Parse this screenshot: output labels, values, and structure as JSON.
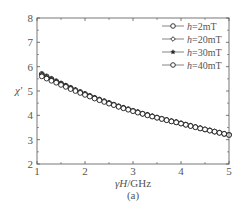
{
  "figure": {
    "caption": "(a)"
  },
  "chart_data": {
    "type": "line",
    "title": "",
    "xlabel": "γH/GHz",
    "xlabel_parts": {
      "var": "γH",
      "unit": "/GHz"
    },
    "ylabel": "χ'",
    "xlim": [
      1,
      5
    ],
    "ylim": [
      2,
      8
    ],
    "xticks": [
      1,
      2,
      3,
      4,
      5
    ],
    "yticks": [
      2,
      3,
      4,
      5,
      6,
      7,
      8
    ],
    "grid": false,
    "legend_position": "upper right",
    "x": [
      1.1,
      1.2,
      1.3,
      1.4,
      1.5,
      1.6,
      1.7,
      1.8,
      1.9,
      2.0,
      2.1,
      2.2,
      2.3,
      2.4,
      2.5,
      2.6,
      2.7,
      2.8,
      2.9,
      3.0,
      3.1,
      3.2,
      3.3,
      3.4,
      3.5,
      3.6,
      3.7,
      3.8,
      3.9,
      4.0,
      4.1,
      4.2,
      4.3,
      4.4,
      4.5,
      4.6,
      4.7,
      4.8,
      4.9,
      5.0
    ],
    "series": [
      {
        "name": "h=2mT",
        "label_var": "h",
        "label_value": "=2mT",
        "marker": "circle",
        "values": [
          5.7,
          5.6,
          5.5,
          5.4,
          5.31,
          5.22,
          5.13,
          5.04,
          4.96,
          4.88,
          4.8,
          4.72,
          4.65,
          4.58,
          4.51,
          4.44,
          4.37,
          4.31,
          4.25,
          4.19,
          4.13,
          4.07,
          4.02,
          3.96,
          3.91,
          3.86,
          3.81,
          3.76,
          3.72,
          3.67,
          3.62,
          3.57,
          3.52,
          3.47,
          3.42,
          3.38,
          3.33,
          3.29,
          3.24,
          3.2
        ]
      },
      {
        "name": "h=20mT",
        "label_var": "h",
        "label_value": "=20mT",
        "marker": "diamond",
        "values": [
          5.69,
          5.59,
          5.49,
          5.4,
          5.31,
          5.22,
          5.13,
          5.04,
          4.96,
          4.88,
          4.8,
          4.72,
          4.65,
          4.58,
          4.51,
          4.44,
          4.37,
          4.31,
          4.25,
          4.19,
          4.13,
          4.07,
          4.02,
          3.96,
          3.91,
          3.86,
          3.81,
          3.76,
          3.72,
          3.67,
          3.62,
          3.57,
          3.52,
          3.47,
          3.42,
          3.38,
          3.33,
          3.29,
          3.24,
          3.2
        ]
      },
      {
        "name": "h=30mT",
        "label_var": "h",
        "label_value": "=30mT",
        "marker": "star",
        "values": [
          5.67,
          5.57,
          5.48,
          5.39,
          5.3,
          5.21,
          5.12,
          5.03,
          4.95,
          4.87,
          4.79,
          4.72,
          4.65,
          4.58,
          4.51,
          4.44,
          4.37,
          4.31,
          4.25,
          4.19,
          4.13,
          4.07,
          4.02,
          3.96,
          3.91,
          3.86,
          3.81,
          3.76,
          3.72,
          3.67,
          3.62,
          3.57,
          3.52,
          3.47,
          3.42,
          3.38,
          3.33,
          3.29,
          3.24,
          3.2
        ]
      },
      {
        "name": "h=40mT",
        "label_var": "h",
        "label_value": "=40mT",
        "marker": "circle",
        "values": [
          5.6,
          5.51,
          5.42,
          5.34,
          5.25,
          5.17,
          5.08,
          5.0,
          4.92,
          4.84,
          4.77,
          4.69,
          4.62,
          4.55,
          4.48,
          4.42,
          4.35,
          4.29,
          4.23,
          4.17,
          4.11,
          4.06,
          4.0,
          3.95,
          3.9,
          3.85,
          3.8,
          3.75,
          3.71,
          3.66,
          3.61,
          3.56,
          3.51,
          3.46,
          3.42,
          3.37,
          3.33,
          3.28,
          3.24,
          3.19
        ]
      }
    ]
  },
  "colors": {
    "axis": "#555555",
    "marker_stroke": "#222222",
    "marker_fill": "#ffffff",
    "legend_line": "#666666",
    "background": "#ffffff"
  }
}
